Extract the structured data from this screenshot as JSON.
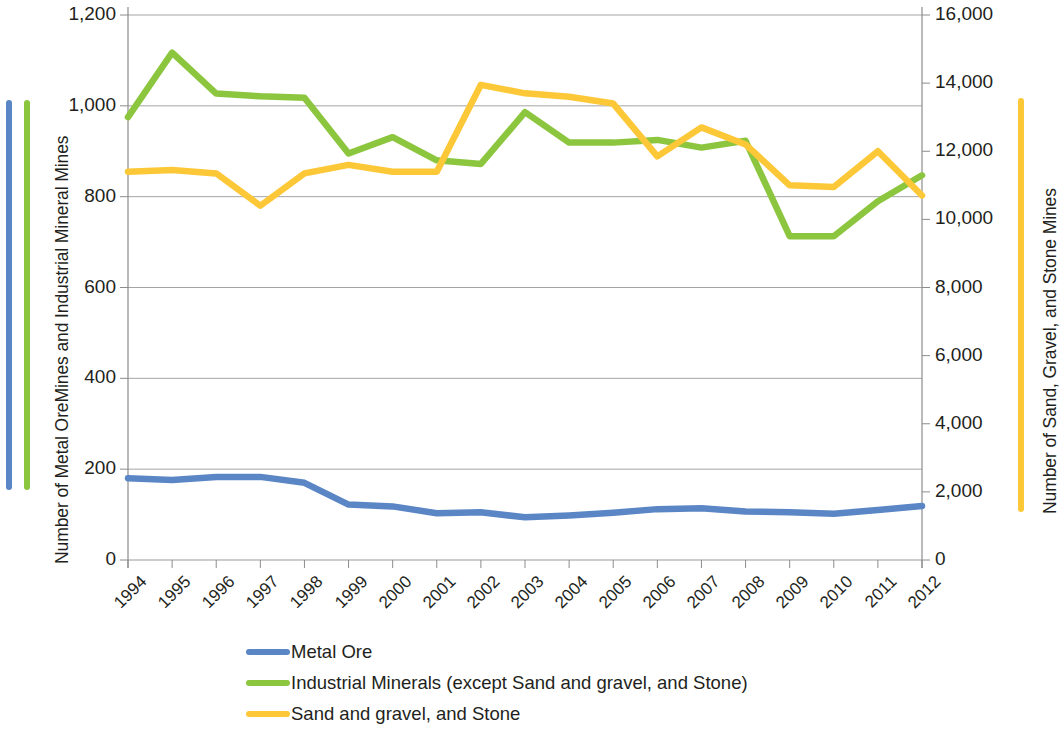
{
  "chart_data": {
    "type": "line",
    "title": "",
    "xlabel": "",
    "categories": [
      "1994",
      "1995",
      "1996",
      "1997",
      "1998",
      "1999",
      "2000",
      "2001",
      "2002",
      "2003",
      "2004",
      "2005",
      "2006",
      "2007",
      "2008",
      "2009",
      "2010",
      "2011",
      "2012"
    ],
    "axes": {
      "left": {
        "label": "Number of Metal OreMines and Industrial Mineral Mines",
        "ticks": [
          "0",
          "200",
          "400",
          "600",
          "800",
          "1,000",
          "1,200"
        ],
        "min": 0,
        "max": 1200,
        "step": 200
      },
      "right": {
        "label": "Number of Sand, Gravel, and Stone Mines",
        "ticks": [
          "0",
          "2,000",
          "4,000",
          "6,000",
          "8,000",
          "10,000",
          "12,000",
          "14,000",
          "16,000"
        ],
        "min": 0,
        "max": 16000,
        "step": 2000
      }
    },
    "grid": true,
    "legend_position": "bottom",
    "series": [
      {
        "name": "Metal Ore",
        "color": "#5b86c5",
        "axis": "left",
        "values": [
          180,
          176,
          183,
          183,
          170,
          122,
          118,
          103,
          105,
          94,
          98,
          104,
          112,
          114,
          107,
          105,
          102,
          110,
          119
        ]
      },
      {
        "name": "Industrial Minerals (except Sand and gravel, and Stone)",
        "color": "#8cc63f",
        "axis": "left",
        "values": [
          975,
          1117,
          1027,
          1021,
          1018,
          895,
          931,
          880,
          872,
          986,
          919,
          919,
          925,
          908,
          923,
          713,
          713,
          790,
          847
        ]
      },
      {
        "name": "Sand and gravel, and Stone",
        "color": "#fdc838",
        "axis": "right",
        "values": [
          11400,
          11450,
          11350,
          10400,
          11350,
          11600,
          11400,
          11400,
          13950,
          13700,
          13600,
          13400,
          11850,
          12700,
          12200,
          11000,
          10950,
          12000,
          10700
        ]
      }
    ]
  },
  "legend": {
    "items": [
      {
        "label": "Metal Ore",
        "color": "#5b86c5"
      },
      {
        "label": "Industrial Minerals (except Sand and gravel, and Stone)",
        "color": "#8cc63f"
      },
      {
        "label": "Sand and gravel, and Stone",
        "color": "#fdc838"
      }
    ]
  }
}
